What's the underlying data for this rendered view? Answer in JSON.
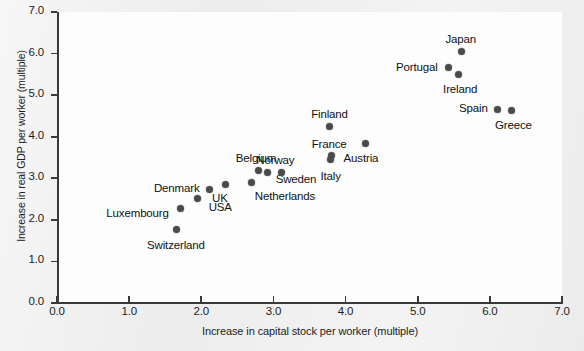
{
  "chart_data": {
    "type": "scatter",
    "title": "",
    "xlabel": "Increase in capital stock per worker (multiple)",
    "ylabel": "Increase in real GDP per worker (multiple)",
    "xlim": [
      0.0,
      7.0
    ],
    "ylim": [
      0.0,
      7.0
    ],
    "xticks": [
      "0.0",
      "1.0",
      "2.0",
      "3.0",
      "4.0",
      "5.0",
      "6.0",
      "7.0"
    ],
    "yticks": [
      "0.0",
      "1.0",
      "2.0",
      "3.0",
      "4.0",
      "5.0",
      "6.0",
      "7.0"
    ],
    "grid": false,
    "legend": "none",
    "marker_color": "#4a4a4a",
    "points": [
      {
        "label": "Switzerland",
        "x": 1.65,
        "y": 1.76,
        "label_dx": 0,
        "label_dy": 16,
        "label_align": "center"
      },
      {
        "label": "Luxembourg",
        "x": 1.71,
        "y": 2.28,
        "label_dx": -12,
        "label_dy": 6,
        "label_align": "right"
      },
      {
        "label": "USA",
        "x": 1.95,
        "y": 2.51,
        "label_dx": 11,
        "label_dy": 9,
        "label_align": "left"
      },
      {
        "label": "Denmark",
        "x": 2.12,
        "y": 2.74,
        "label_dx": -10,
        "label_dy": 0,
        "label_align": "right"
      },
      {
        "label": "UK",
        "x": 2.33,
        "y": 2.85,
        "label_dx": -5,
        "label_dy": 14,
        "label_align": "center"
      },
      {
        "label": "Netherlands",
        "x": 2.7,
        "y": 2.89,
        "label_dx": 3,
        "label_dy": 14,
        "label_align": "left"
      },
      {
        "label": "Belgium",
        "x": 2.79,
        "y": 3.19,
        "label_dx": -2,
        "label_dy": -11,
        "label_align": "center"
      },
      {
        "label": "Sweden",
        "x": 2.92,
        "y": 3.13,
        "label_dx": 8,
        "label_dy": 7,
        "label_align": "left"
      },
      {
        "label": "Norway",
        "x": 3.11,
        "y": 3.15,
        "label_dx": -6,
        "label_dy": -11,
        "label_align": "center"
      },
      {
        "label": "Italy",
        "x": 3.79,
        "y": 3.44,
        "label_dx": 0,
        "label_dy": 17,
        "label_align": "center"
      },
      {
        "label": "France",
        "x": 3.8,
        "y": 3.55,
        "label_dx": -2,
        "label_dy": -10,
        "label_align": "center"
      },
      {
        "label": "Austria",
        "x": 4.27,
        "y": 3.83,
        "label_dx": -4,
        "label_dy": 15,
        "label_align": "center"
      },
      {
        "label": "Finland",
        "x": 3.78,
        "y": 4.25,
        "label_dx": 0,
        "label_dy": -11,
        "label_align": "center"
      },
      {
        "label": "Spain",
        "x": 6.1,
        "y": 4.66,
        "label_dx": -9,
        "label_dy": 0,
        "label_align": "right"
      },
      {
        "label": "Greece",
        "x": 6.3,
        "y": 4.63,
        "label_dx": 2,
        "label_dy": 15,
        "label_align": "center"
      },
      {
        "label": "Ireland",
        "x": 5.56,
        "y": 5.49,
        "label_dx": 2,
        "label_dy": 15,
        "label_align": "center"
      },
      {
        "label": "Portugal",
        "x": 5.42,
        "y": 5.66,
        "label_dx": -10,
        "label_dy": 0,
        "label_align": "right"
      },
      {
        "label": "Japan",
        "x": 5.6,
        "y": 6.06,
        "label_dx": 0,
        "label_dy": -11,
        "label_align": "center"
      }
    ]
  }
}
